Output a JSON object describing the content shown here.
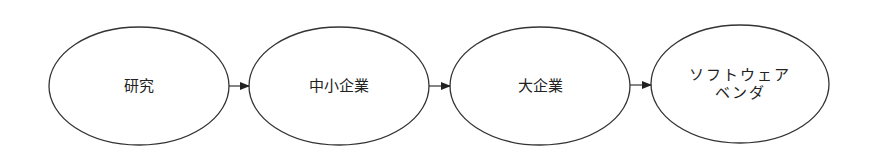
{
  "diagram": {
    "type": "flow",
    "colors": {
      "stroke": "#333333",
      "fill": "#ffffff",
      "text": "#222222"
    },
    "nodes": [
      {
        "id": "research",
        "label": "研究",
        "shape": "ellipse"
      },
      {
        "id": "sme",
        "label": "中小企業",
        "shape": "ellipse"
      },
      {
        "id": "large-enterprise",
        "label": "大企業",
        "shape": "ellipse"
      },
      {
        "id": "software-vendor",
        "label": "ソフトウェア\nベンダ",
        "shape": "ellipse"
      }
    ],
    "edges": [
      {
        "from": "research",
        "to": "sme"
      },
      {
        "from": "sme",
        "to": "large-enterprise"
      },
      {
        "from": "large-enterprise",
        "to": "software-vendor"
      }
    ]
  }
}
